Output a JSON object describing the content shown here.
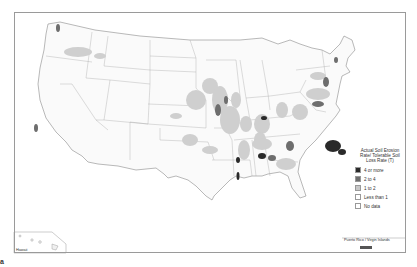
{
  "legend": {
    "title": "Actual Soil Erosion Rate/ Tolerable Soil Loss Rate (T)",
    "items": [
      {
        "label": "4 or more",
        "color": "#2a2a2a"
      },
      {
        "label": "2 to 4",
        "color": "#6e6e6e"
      },
      {
        "label": "1 to 2",
        "color": "#c8c8c8"
      },
      {
        "label": "Less than 1",
        "color": "#ffffff"
      },
      {
        "label": "No data",
        "color": "#ffffff"
      }
    ]
  },
  "insets": {
    "hawaii": "Hawaii",
    "puerto_rico": "Puerto Rico / Virgin Islands"
  },
  "corner_mark": "a"
}
